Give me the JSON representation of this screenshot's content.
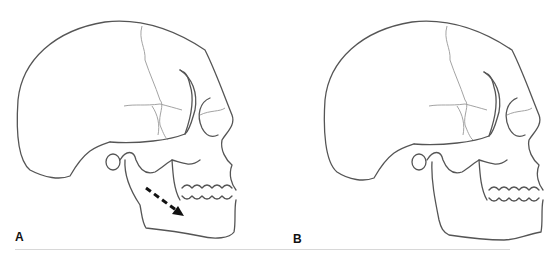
{
  "figure": {
    "panels": [
      {
        "label": "A",
        "description": "Lateral skull with dashed arrow on mandible indicating downward/forward displacement",
        "arrow": "dashed-arrow-down-right"
      },
      {
        "label": "B",
        "description": "Lateral skull without annotation"
      }
    ],
    "colors": {
      "outline": "#555555",
      "suture": "#999999",
      "arrow": "#111111",
      "divider": "#d8d8d8"
    }
  }
}
